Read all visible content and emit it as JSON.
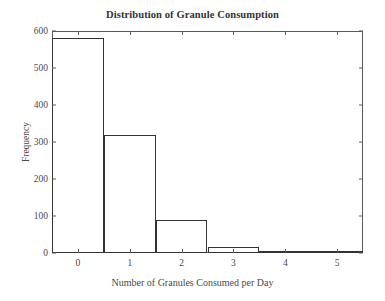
{
  "chart_data": {
    "type": "bar",
    "title": "Distribution of Granule Consumption",
    "xlabel": "Number of Granules Consumed per Day",
    "ylabel": "Frequency",
    "categories": [
      "0",
      "1",
      "2",
      "3",
      "4",
      "5"
    ],
    "values": [
      580,
      318,
      88,
      15,
      2,
      1
    ],
    "bin_width": 1,
    "xlim": [
      -0.5,
      5.5
    ],
    "ylim": [
      0,
      600
    ],
    "xticks": [
      "0",
      "1",
      "2",
      "3",
      "4",
      "5"
    ],
    "xtick_values": [
      0,
      1,
      2,
      3,
      4,
      5
    ],
    "yticks": [
      "0",
      "100",
      "200",
      "300",
      "400",
      "500",
      "600"
    ],
    "ytick_values": [
      0,
      100,
      200,
      300,
      400,
      500,
      600
    ],
    "grid": false,
    "legend": null,
    "bar_edge_color": "#333333",
    "bar_fill_color": "#ffffff",
    "axis_color": "#5a5a5a",
    "text_color": "#4a4a4a",
    "background_color": "#ffffff"
  }
}
